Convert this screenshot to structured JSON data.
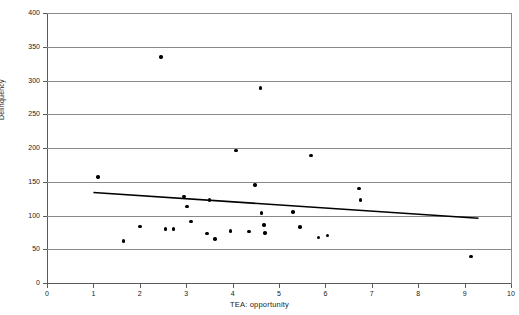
{
  "chart_data": {
    "type": "scatter",
    "title": "",
    "xlabel": "TEA: opportunity",
    "ylabel": "Delinquency",
    "xlim": [
      0,
      10
    ],
    "ylim": [
      0,
      400
    ],
    "xticks": [
      0,
      1,
      2,
      3,
      4,
      5,
      6,
      7,
      8,
      9,
      10
    ],
    "yticks": [
      0,
      50,
      100,
      150,
      200,
      250,
      300,
      350,
      400
    ],
    "grid": "horizontal",
    "legend": "none",
    "marker_color": "#000000",
    "trendline_color": "#000000",
    "points": [
      {
        "x": 1.1,
        "y": 157
      },
      {
        "x": 1.65,
        "y": 62
      },
      {
        "x": 2.0,
        "y": 84
      },
      {
        "x": 2.46,
        "y": 335
      },
      {
        "x": 2.55,
        "y": 80
      },
      {
        "x": 2.72,
        "y": 80
      },
      {
        "x": 2.95,
        "y": 128
      },
      {
        "x": 3.02,
        "y": 113
      },
      {
        "x": 3.1,
        "y": 91
      },
      {
        "x": 3.45,
        "y": 73
      },
      {
        "x": 3.5,
        "y": 123
      },
      {
        "x": 3.62,
        "y": 65
      },
      {
        "x": 3.95,
        "y": 77
      },
      {
        "x": 4.07,
        "y": 196
      },
      {
        "x": 4.35,
        "y": 76
      },
      {
        "x": 4.48,
        "y": 145
      },
      {
        "x": 4.6,
        "y": 289
      },
      {
        "x": 4.62,
        "y": 104
      },
      {
        "x": 4.68,
        "y": 86
      },
      {
        "x": 4.7,
        "y": 74
      },
      {
        "x": 5.3,
        "y": 105
      },
      {
        "x": 5.45,
        "y": 83
      },
      {
        "x": 5.69,
        "y": 189
      },
      {
        "x": 5.85,
        "y": 67
      },
      {
        "x": 6.05,
        "y": 70
      },
      {
        "x": 6.72,
        "y": 140
      },
      {
        "x": 6.75,
        "y": 123
      },
      {
        "x": 9.14,
        "y": 39
      }
    ],
    "trendline": {
      "x1": 1.0,
      "y1": 134,
      "x2": 9.3,
      "y2": 96
    }
  },
  "axes": {
    "ylabel": "Delinquency",
    "xlabel": "TEA: opportunity"
  }
}
